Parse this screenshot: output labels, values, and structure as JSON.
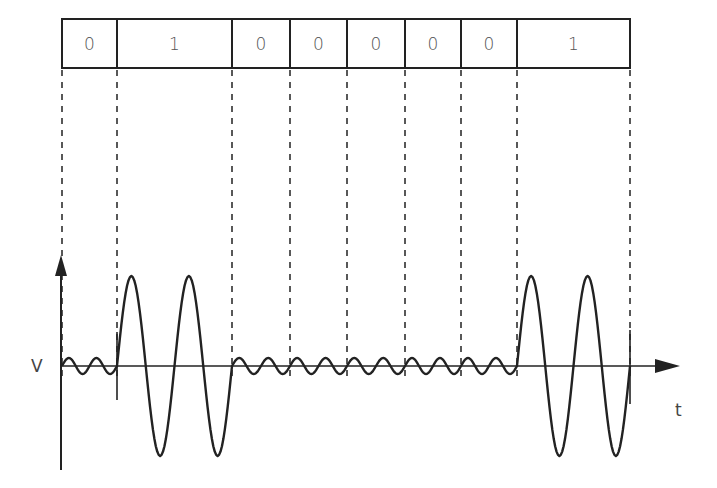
{
  "diagram": {
    "type": "ask-modulation-waveform",
    "bit_sequence": [
      "0",
      "1",
      "0",
      "0",
      "0",
      "0",
      "0",
      "1"
    ],
    "bit_boundaries_x": [
      62,
      117,
      232,
      290,
      347,
      405,
      461,
      517,
      630
    ],
    "axes": {
      "y_label": "V",
      "x_label": "t",
      "y_axis_has_arrow": true,
      "x_axis_has_arrow": true
    },
    "waveform": {
      "one_amplitude": 90,
      "one_cycles_per_bit": 2,
      "zero_amplitude": 8,
      "zero_cycles_per_bit": 2
    },
    "colors": {
      "stroke": "#222222",
      "text": "#555555",
      "background": "#ffffff"
    }
  }
}
